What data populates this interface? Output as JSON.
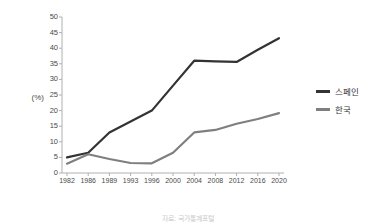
{
  "chart_data": {
    "type": "line",
    "title": "",
    "xlabel": "",
    "ylabel": "(%)",
    "categories": [
      "1982",
      "1986",
      "1989",
      "1993",
      "1996",
      "2000",
      "2004",
      "2008",
      "2012",
      "2016",
      "2020"
    ],
    "ylim": [
      0,
      50
    ],
    "y_ticks": [
      0,
      5,
      10,
      15,
      20,
      25,
      30,
      35,
      40,
      45,
      50
    ],
    "grid": false,
    "legend_position": "right",
    "series": [
      {
        "name": "스페인",
        "color": "#333333",
        "values": [
          5,
          6.5,
          13,
          16.5,
          20,
          28,
          36,
          35.8,
          35.6,
          39.5,
          43.2
        ]
      },
      {
        "name": "한국",
        "color": "#7f7f7f",
        "values": [
          3,
          6,
          4.5,
          3.2,
          3.1,
          6.5,
          13,
          13.8,
          15.8,
          17.3,
          19.2
        ]
      }
    ]
  },
  "axis": {
    "y_label": "(%)"
  },
  "legend": {
    "items": [
      {
        "label": "스페인",
        "color": "#333333"
      },
      {
        "label": "한국",
        "color": "#7f7f7f"
      }
    ]
  },
  "caption": {
    "text": "자료: 국가통계포털"
  },
  "colors": {
    "spain_line": "#333333",
    "korea_line": "#7f7f7f",
    "axis": "#b0b0b0",
    "text": "#4a4a4a",
    "background": "#ffffff"
  }
}
